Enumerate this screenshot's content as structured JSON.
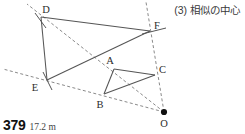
{
  "heading": {
    "number": "(3)",
    "text": "相似の中心",
    "full": "(3) 相似の中心"
  },
  "footer": {
    "problem_number": "379",
    "answer": "17.2 m"
  },
  "colors": {
    "solid_line": "#555555",
    "dashed_line": "#8a8a8a",
    "label": "#2b2b2b",
    "center_dot": "#111111",
    "background": "#ffffff"
  },
  "figure": {
    "points": [
      {
        "name": "D",
        "x": 41,
        "y": 17,
        "label": "D",
        "label_x": 46,
        "label_y": 13
      },
      {
        "name": "F",
        "x": 150,
        "y": 31,
        "label": "F",
        "label_x": 154,
        "label_y": 29
      },
      {
        "name": "E",
        "x": 47,
        "y": 80,
        "label": "E",
        "label_x": 35,
        "label_y": 91
      },
      {
        "name": "A",
        "x": 114,
        "y": 69,
        "label": "A",
        "label_x": 110,
        "label_y": 64
      },
      {
        "name": "B",
        "x": 104,
        "y": 94,
        "label": "B",
        "label_x": 100,
        "label_y": 108
      },
      {
        "name": "C",
        "x": 155,
        "y": 75,
        "label": "C",
        "label_x": 159,
        "label_y": 73
      },
      {
        "name": "O",
        "x": 164,
        "y": 112,
        "label": "O",
        "label_x": 160,
        "label_y": 127
      }
    ],
    "solid_segments": [
      {
        "name": "segment-D-F",
        "x1": 41,
        "y1": 17,
        "x2": 150,
        "y2": 31
      },
      {
        "name": "segment-D-E",
        "x1": 41,
        "y1": 17,
        "x2": 47,
        "y2": 80
      },
      {
        "name": "segment-E-F",
        "x1": 47,
        "y1": 80,
        "x2": 150,
        "y2": 31
      },
      {
        "name": "segment-A-C",
        "x1": 114,
        "y1": 69,
        "x2": 155,
        "y2": 75
      },
      {
        "name": "segment-A-B",
        "x1": 114,
        "y1": 69,
        "x2": 104,
        "y2": 94
      },
      {
        "name": "segment-B-C",
        "x1": 104,
        "y1": 94,
        "x2": 155,
        "y2": 75
      },
      {
        "name": "tick-through-F",
        "x1": 142,
        "y1": 34,
        "x2": 166,
        "y2": 28
      },
      {
        "name": "tick-through-D",
        "x1": 35,
        "y1": 13,
        "x2": 46,
        "y2": 28
      },
      {
        "name": "tick-through-E",
        "x1": 43,
        "y1": 72,
        "x2": 52,
        "y2": 90
      }
    ],
    "dashed_rays": [
      {
        "name": "ray-O-A-D",
        "x1": 164,
        "y1": 112,
        "x2": 27,
        "y2": 4
      },
      {
        "name": "ray-O-B-E",
        "x1": 164,
        "y1": 112,
        "x2": 3,
        "y2": 69
      },
      {
        "name": "ray-O-C-F",
        "x1": 164,
        "y1": 112,
        "x2": 146,
        "y2": 2
      }
    ],
    "center_of_similarity": "O",
    "triangles": [
      {
        "name": "triangle-ABC",
        "vertices": [
          "A",
          "B",
          "C"
        ]
      },
      {
        "name": "triangle-DEF",
        "vertices": [
          "D",
          "E",
          "F"
        ]
      }
    ]
  }
}
